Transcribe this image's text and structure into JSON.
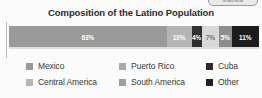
{
  "badge": {
    "text": "statista"
  },
  "chart_data": {
    "type": "bar",
    "orientation": "horizontal-stacked",
    "title": "Composition of the Latino Population",
    "xlabel": "",
    "ylabel": "",
    "xlim": [
      0,
      100
    ],
    "grid": false,
    "legend_position": "bottom",
    "categories": [
      "Mexico",
      "Puerto Rico",
      "Cuba",
      "Central America",
      "South America",
      "Other"
    ],
    "values": [
      63,
      10,
      4,
      7,
      5,
      11
    ],
    "value_labels": [
      "63%",
      "10%",
      "4%",
      "7%",
      "5%",
      "11%"
    ],
    "colors": [
      "#9a9a9a",
      "#b4b4b4",
      "#2f2f2f",
      "#d8d8d8",
      "#8d8d8d",
      "#1c1c1c"
    ],
    "label_colors": [
      "#ffffff",
      "#ffffff",
      "#ffffff",
      "#6a6a6a",
      "#ffffff",
      "#ffffff"
    ],
    "segments": [
      {
        "label": "Mexico",
        "value": 63,
        "value_label": "63%",
        "color": "#9a9a9a",
        "label_color": "#ffffff"
      },
      {
        "label": "Puerto Rico",
        "value": 10,
        "value_label": "10%",
        "color": "#b4b4b4",
        "label_color": "#ffffff"
      },
      {
        "label": "Cuba",
        "value": 4,
        "value_label": "4%",
        "color": "#2f2f2f",
        "label_color": "#ffffff"
      },
      {
        "label": "Central America",
        "value": 7,
        "value_label": "7%",
        "color": "#d8d8d8",
        "label_color": "#6f6f6f"
      },
      {
        "label": "South America",
        "value": 5,
        "value_label": "5%",
        "color": "#8d8d8d",
        "label_color": "#ffffff"
      },
      {
        "label": "Other",
        "value": 11,
        "value_label": "11%",
        "color": "#1c1c1c",
        "label_color": "#ffffff"
      }
    ]
  },
  "legend": {
    "items": [
      {
        "label": "Mexico",
        "color": "#9a9a9a"
      },
      {
        "label": "Puerto Rico",
        "color": "#a9a9a9"
      },
      {
        "label": "Cuba",
        "color": "#2b2b2b"
      },
      {
        "label": "Central America",
        "color": "#b6b6b6"
      },
      {
        "label": "South America",
        "color": "#9f9f9f"
      },
      {
        "label": "Other",
        "color": "#222222"
      }
    ]
  }
}
